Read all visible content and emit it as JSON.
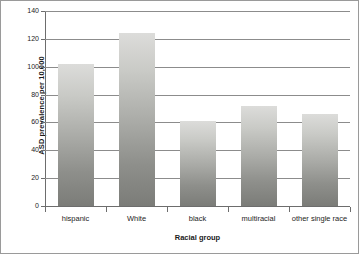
{
  "chart_data": {
    "type": "bar",
    "title": "",
    "categories": [
      "hispanic",
      "White",
      "black",
      "multiracial",
      "other single race"
    ],
    "values": [
      102,
      124,
      61,
      72,
      66
    ],
    "xlabel": "Racial group",
    "ylabel": "ASD prevalence per 10,000",
    "ylim": [
      0,
      140
    ],
    "yticks": [
      0,
      20,
      40,
      60,
      80,
      100,
      120,
      140
    ],
    "ytick_labels": [
      "0",
      "20",
      "40",
      "60",
      "80",
      "100",
      "120",
      "140"
    ],
    "grid": true,
    "legend": false,
    "bar_color_top": "#dcdcda",
    "bar_color_bottom": "#7b7c78",
    "gridline_color": "#8c8c8c",
    "axis_color": "#6d6d6d",
    "background": "#ffffff",
    "border_color": "#9a9a9a"
  }
}
